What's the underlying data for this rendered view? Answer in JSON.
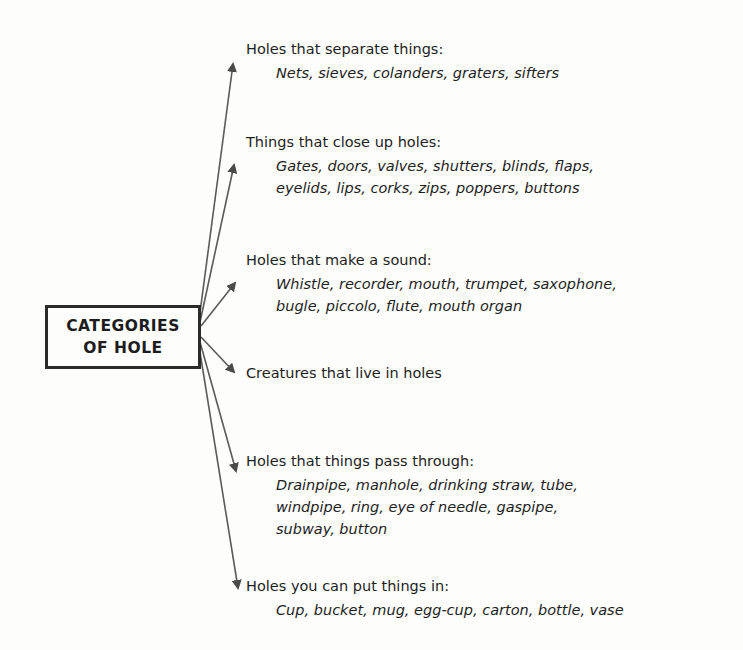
{
  "center": {
    "line1": "CATEGORIES",
    "line2": "OF HOLE"
  },
  "categories": [
    {
      "heading": "Holes that separate things:",
      "items": [
        "Nets, sieves, colanders, graters, sifters"
      ]
    },
    {
      "heading": "Things that close up holes:",
      "items": [
        "Gates, doors, valves, shutters, blinds, flaps,",
        "eyelids, lips, corks, zips, poppers, buttons"
      ]
    },
    {
      "heading": "Holes that make a sound:",
      "items": [
        "Whistle, recorder, mouth, trumpet, saxophone,",
        "bugle, piccolo, flute, mouth organ"
      ]
    },
    {
      "heading": "Creatures that live in holes",
      "items": []
    },
    {
      "heading": "Holes that things pass through:",
      "items": [
        "Drainpipe, manhole, drinking straw, tube,",
        "windpipe, ring, eye of needle, gaspipe,",
        "subway, button"
      ]
    },
    {
      "heading": "Holes you can put things in:",
      "items": [
        "Cup, bucket, mug, egg-cup, carton, bottle, vase"
      ]
    }
  ],
  "colors": {
    "ink": "#1e1e1e",
    "arrow": "#4a4a4a",
    "background": "#fdfdfc"
  }
}
